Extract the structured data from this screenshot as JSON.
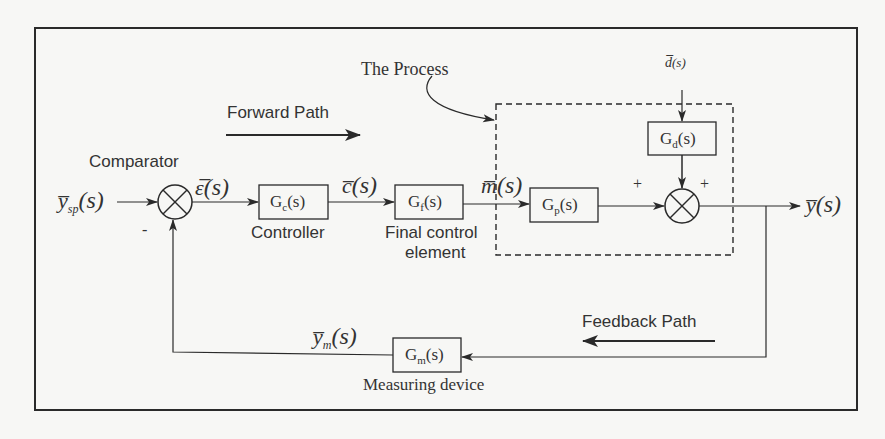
{
  "diagram": {
    "type": "feedback-control-block-diagram",
    "colors": {
      "background": "#f7f7f5",
      "stroke": "#2a2a2a"
    },
    "labels": {
      "process": "The Process",
      "forward_path": "Forward Path",
      "feedback_path": "Feedback Path",
      "comparator": "Comparator",
      "controller": "Controller",
      "final_control_line1": "Final control",
      "final_control_line2": "element",
      "measuring_device": "Measuring device"
    },
    "signals": {
      "setpoint": "y̅sp(s)",
      "setpoint_main": "y̅",
      "setpoint_sub": "sp",
      "setpoint_arg": "(s)",
      "error": "ε̅(s)",
      "error_main": "ε̅",
      "error_arg": "(s)",
      "controller_out": "c̅(s)",
      "controller_out_main": "c̅",
      "controller_out_arg": "(s)",
      "manipulated": "m̅(s)",
      "manipulated_main": "m̅",
      "manipulated_arg": "(s)",
      "disturbance": "d̅(s)",
      "disturbance_main": "d̅",
      "disturbance_arg": "(s)",
      "output": "y̅(s)",
      "output_main": "y̅",
      "output_arg": "(s)",
      "measured": "y̅m(s)",
      "measured_main": "y̅",
      "measured_sub": "m",
      "measured_arg": "(s)"
    },
    "blocks": {
      "gc": {
        "main": "G",
        "sub": "c",
        "arg": "(s)"
      },
      "gf": {
        "main": "G",
        "sub": "f",
        "arg": "(s)"
      },
      "gp": {
        "main": "G",
        "sub": "p",
        "arg": "(s)"
      },
      "gd": {
        "main": "G",
        "sub": "d",
        "arg": "(s)"
      },
      "gm": {
        "main": "G",
        "sub": "m",
        "arg": "(s)"
      }
    },
    "signs": {
      "comparator_feedback": "-",
      "junction_process": "+",
      "junction_disturbance": "+"
    }
  }
}
